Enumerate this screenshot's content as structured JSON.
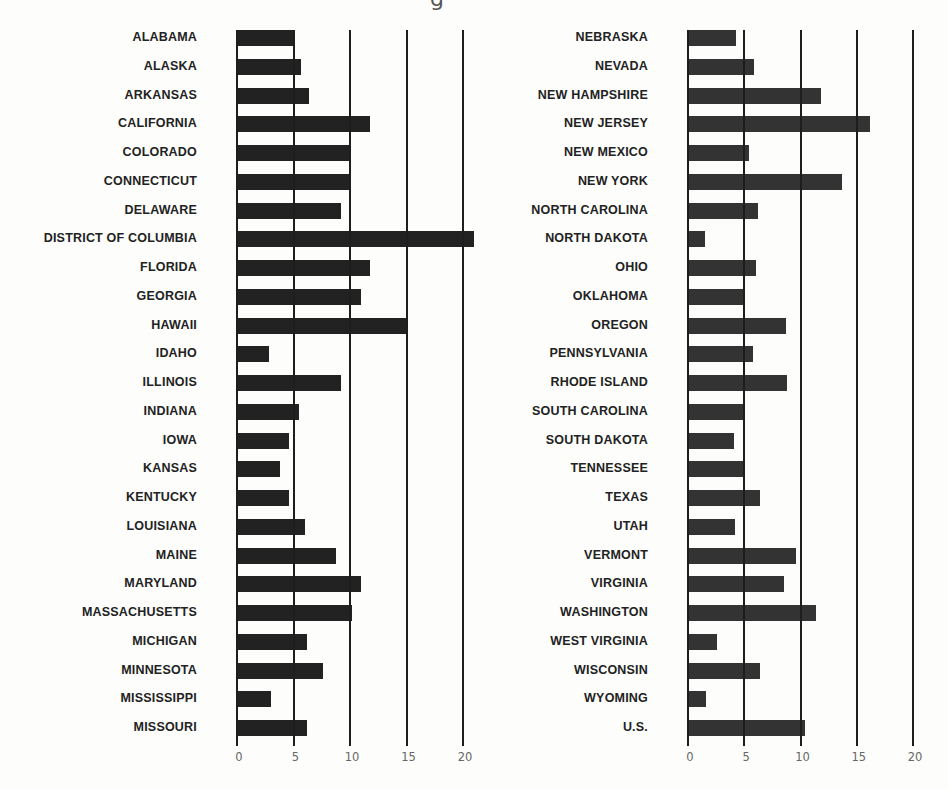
{
  "title_fragment": "g",
  "chart_data": [
    {
      "type": "bar",
      "orientation": "horizontal",
      "title": "",
      "xlabel": "",
      "ylabel": "",
      "xlim": [
        0,
        20
      ],
      "ticks": [
        0,
        5,
        10,
        15,
        20
      ],
      "tick_labels": [
        "0",
        "5",
        "10",
        "15",
        "20"
      ],
      "grid": true,
      "bar_color": "#222222",
      "categories": [
        "ALABAMA",
        "ALASKA",
        "ARKANSAS",
        "CALIFORNIA",
        "COLORADO",
        "CONNECTICUT",
        "DELAWARE",
        "DISTRICT OF COLUMBIA",
        "FLORIDA",
        "GEORGIA",
        "HAWAII",
        "IDAHO",
        "ILLINOIS",
        "INDIANA",
        "IOWA",
        "KANSAS",
        "KENTUCKY",
        "LOUISIANA",
        "MAINE",
        "MARYLAND",
        "MASSACHUSETTS",
        "MICHIGAN",
        "MINNESOTA",
        "MISSISSIPPI",
        "MISSOURI"
      ],
      "values": [
        5.0,
        5.7,
        6.4,
        11.8,
        10.0,
        10.0,
        9.2,
        21.0,
        11.8,
        11.0,
        15.0,
        2.8,
        9.2,
        5.5,
        4.6,
        3.8,
        4.6,
        6.0,
        8.8,
        11.0,
        10.2,
        6.2,
        7.6,
        3.0,
        6.2
      ]
    },
    {
      "type": "bar",
      "orientation": "horizontal",
      "title": "",
      "xlabel": "",
      "ylabel": "",
      "xlim": [
        0,
        20
      ],
      "ticks": [
        0,
        5,
        10,
        15,
        20
      ],
      "tick_labels": [
        "0",
        "5",
        "10",
        "15",
        "20"
      ],
      "grid": true,
      "bar_color": "#333333",
      "categories": [
        "NEBRASKA",
        "NEVADA",
        "NEW HAMPSHIRE",
        "NEW JERSEY",
        "NEW MEXICO",
        "NEW YORK",
        "NORTH CAROLINA",
        "NORTH DAKOTA",
        "OHIO",
        "OKLAHOMA",
        "OREGON",
        "PENNSYLVANIA",
        "RHODE ISLAND",
        "SOUTH CAROLINA",
        "SOUTH DAKOTA",
        "TENNESSEE",
        "TEXAS",
        "UTAH",
        "VERMONT",
        "VIRGINIA",
        "WASHINGTON",
        "WEST VIRGINIA",
        "WISCONSIN",
        "WYOMING",
        "U.S."
      ],
      "values": [
        4.3,
        5.9,
        11.8,
        16.2,
        5.4,
        13.7,
        6.2,
        1.5,
        6.0,
        5.1,
        8.7,
        5.8,
        8.8,
        5.1,
        4.1,
        5.1,
        6.4,
        4.2,
        9.6,
        8.5,
        11.4,
        2.6,
        6.4,
        1.6,
        10.4
      ]
    }
  ]
}
